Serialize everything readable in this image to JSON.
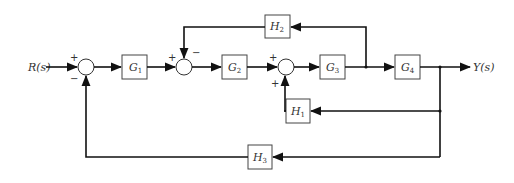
{
  "diagram": {
    "type": "block-diagram",
    "input_label": "R(s)",
    "output_label": "Y(s)",
    "blocks": {
      "G1": {
        "name": "G",
        "sub": "1"
      },
      "G2": {
        "name": "G",
        "sub": "2"
      },
      "G3": {
        "name": "G",
        "sub": "3"
      },
      "G4": {
        "name": "G",
        "sub": "4"
      },
      "H1": {
        "name": "H",
        "sub": "1"
      },
      "H2": {
        "name": "H",
        "sub": "2"
      },
      "H3": {
        "name": "H",
        "sub": "3"
      }
    },
    "summing_junctions": {
      "S1": {
        "signs": [
          "+",
          "−"
        ]
      },
      "S2": {
        "signs": [
          "+",
          "−"
        ]
      },
      "S3": {
        "signs": [
          "+",
          "+"
        ]
      }
    }
  }
}
